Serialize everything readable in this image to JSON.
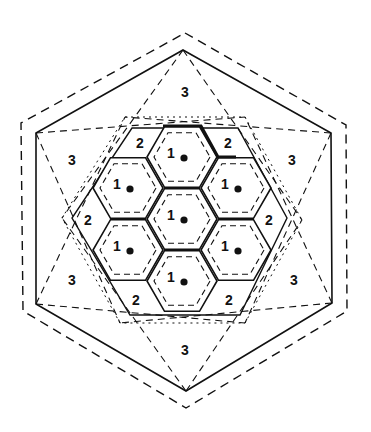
{
  "diagram": {
    "colors": {
      "line": "#111111",
      "background": "#ffffff"
    },
    "outer_dashed_hex": [
      [
        185,
        33
      ],
      [
        346,
        125
      ],
      [
        347,
        311
      ],
      [
        186,
        408
      ],
      [
        23,
        311
      ],
      [
        21,
        123
      ]
    ],
    "outer_solid_hex": [
      [
        183,
        50
      ],
      [
        331,
        133
      ],
      [
        332,
        303
      ],
      [
        186,
        391
      ],
      [
        36,
        304
      ],
      [
        36,
        133
      ]
    ],
    "intermediate_dotted_hex": [
      [
        125,
        117
      ],
      [
        245,
        117
      ],
      [
        302,
        220
      ],
      [
        245,
        323
      ],
      [
        120,
        323
      ],
      [
        62,
        218
      ]
    ],
    "dashed_connectors": [
      [
        [
          183,
          50
        ],
        [
          62,
          218
        ]
      ],
      [
        [
          183,
          50
        ],
        [
          302,
          220
        ]
      ],
      [
        [
          36,
          133
        ],
        [
          245,
          117
        ]
      ],
      [
        [
          36,
          133
        ],
        [
          120,
          323
        ]
      ],
      [
        [
          331,
          133
        ],
        [
          125,
          117
        ]
      ],
      [
        [
          331,
          133
        ],
        [
          245,
          323
        ]
      ],
      [
        [
          36,
          304
        ],
        [
          245,
          323
        ]
      ],
      [
        [
          36,
          304
        ],
        [
          125,
          117
        ]
      ],
      [
        [
          332,
          303
        ],
        [
          120,
          323
        ]
      ],
      [
        [
          332,
          303
        ],
        [
          245,
          117
        ]
      ],
      [
        [
          186,
          391
        ],
        [
          62,
          218
        ]
      ],
      [
        [
          186,
          391
        ],
        [
          302,
          220
        ]
      ]
    ],
    "zone2_boundary_hex": [
      [
        132,
        128
      ],
      [
        238,
        128
      ],
      [
        287,
        218
      ],
      [
        240,
        315
      ],
      [
        130,
        315
      ],
      [
        72,
        218
      ]
    ],
    "cells": [
      {
        "label": "1",
        "cx": 182,
        "cy": 219
      },
      {
        "label": "1",
        "cx": 182,
        "cy": 157
      },
      {
        "label": "1",
        "cx": 182,
        "cy": 281
      },
      {
        "label": "1",
        "cx": 128,
        "cy": 188
      },
      {
        "label": "1",
        "cx": 236,
        "cy": 188
      },
      {
        "label": "1",
        "cx": 128,
        "cy": 250
      },
      {
        "label": "1",
        "cx": 236,
        "cy": 250
      }
    ],
    "zone2_labels": [
      {
        "text": "2",
        "x": 140,
        "y": 143
      },
      {
        "text": "2",
        "x": 228,
        "y": 143
      },
      {
        "text": "2",
        "x": 88,
        "y": 220
      },
      {
        "text": "2",
        "x": 269,
        "y": 220
      },
      {
        "text": "2",
        "x": 136,
        "y": 300
      },
      {
        "text": "2",
        "x": 229,
        "y": 300
      }
    ],
    "zone3_labels": [
      {
        "text": "3",
        "x": 185,
        "y": 92
      },
      {
        "text": "3",
        "x": 72,
        "y": 160
      },
      {
        "text": "3",
        "x": 292,
        "y": 160
      },
      {
        "text": "3",
        "x": 72,
        "y": 280
      },
      {
        "text": "3",
        "x": 294,
        "y": 280
      },
      {
        "text": "3",
        "x": 185,
        "y": 350
      }
    ]
  }
}
